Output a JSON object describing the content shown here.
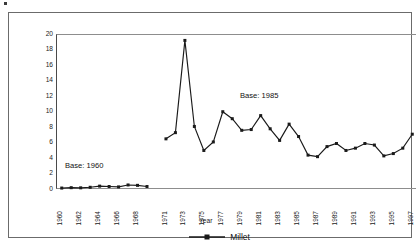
{
  "chart_data": {
    "type": "line",
    "title": "",
    "xlabel": "Year",
    "ylabel": "Price in naira",
    "xlim": [
      1960,
      1997
    ],
    "ylim": [
      0,
      20
    ],
    "ytick_step": 2,
    "grid": false,
    "legend_position": "bottom-center",
    "yticks": [
      "0",
      "2",
      "4",
      "6",
      "8",
      "10",
      "12",
      "14",
      "16",
      "18",
      "20"
    ],
    "xticks": [
      "1960",
      "1962",
      "1964",
      "1966",
      "1968",
      "1971",
      "1973",
      "1975",
      "1977",
      "1979",
      "1981",
      "1983",
      "1985",
      "1987",
      "1989",
      "1991",
      "1993",
      "1995",
      "1997"
    ],
    "annotations": [
      {
        "text": "Base: 1960",
        "x": 1963,
        "y": 3.6
      },
      {
        "text": "Base: 1985",
        "x": 1981,
        "y": 12.6
      }
    ],
    "series": [
      {
        "name": "Millet",
        "color": "#1a1a1a",
        "marker": "square",
        "segments": [
          {
            "label": "Base: 1960",
            "x": [
              1960,
              1961,
              1962,
              1963,
              1964,
              1965,
              1966,
              1967,
              1968,
              1969
            ],
            "values": [
              0.25,
              0.3,
              0.28,
              0.35,
              0.5,
              0.45,
              0.4,
              0.65,
              0.6,
              0.45
            ]
          },
          {
            "label": "Base: 1985",
            "x": [
              1971,
              1972,
              1973,
              1974,
              1975,
              1976,
              1977,
              1978,
              1979,
              1980,
              1981,
              1982,
              1983,
              1984,
              1985,
              1986,
              1987,
              1988,
              1989,
              1990,
              1991,
              1992,
              1993,
              1994,
              1995,
              1996,
              1997
            ],
            "values": [
              6.6,
              7.4,
              19.3,
              8.2,
              5.1,
              6.2,
              10.1,
              9.2,
              7.7,
              7.8,
              9.6,
              7.9,
              6.4,
              8.5,
              6.9,
              4.5,
              4.3,
              5.6,
              6.0,
              5.1,
              5.4,
              6.0,
              5.8,
              4.4,
              4.7,
              5.4,
              7.2
            ]
          }
        ]
      }
    ]
  },
  "legend": {
    "entries": [
      {
        "label": "Millet"
      }
    ]
  }
}
